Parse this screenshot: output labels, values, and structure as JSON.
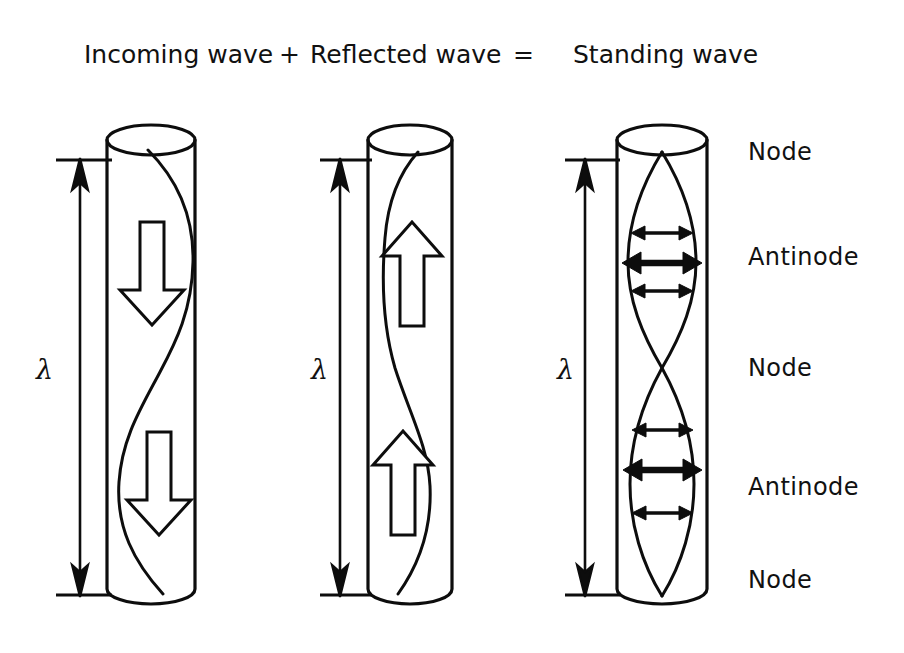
{
  "figure": {
    "title_parts": {
      "incoming": "Incoming wave",
      "plus": "+",
      "reflected": "Reflected wave",
      "equals": "=",
      "standing": "Standing wave"
    },
    "background_color": "#ffffff",
    "ink_color": "#0d0d0d"
  },
  "panels": [
    {
      "id": "incoming-wave-panel",
      "caption": "Incoming wave",
      "wavelength_label": "λ",
      "direction": "down",
      "direction_arrow_count": 2
    },
    {
      "id": "reflected-wave-panel",
      "caption": "Reflected wave",
      "wavelength_label": "λ",
      "direction": "up",
      "direction_arrow_count": 2
    },
    {
      "id": "standing-wave-panel",
      "caption": "Standing wave",
      "wavelength_label": "λ",
      "direction": "none",
      "antinode_arrow_groups": 2
    }
  ],
  "side_labels": [
    {
      "text": "Node",
      "position": "top"
    },
    {
      "text": "Antinode",
      "position": "upper-middle"
    },
    {
      "text": "Node",
      "position": "middle"
    },
    {
      "text": "Antinode",
      "position": "lower-middle"
    },
    {
      "text": "Node",
      "position": "bottom"
    }
  ],
  "wavelength_symbol": "λ"
}
